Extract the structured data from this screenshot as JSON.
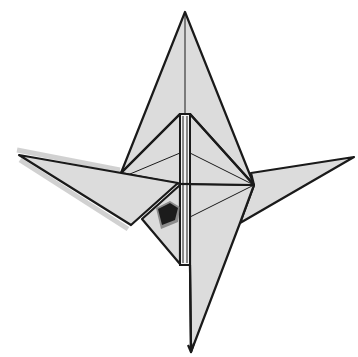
{
  "diagram": {
    "colors": {
      "paper": "#dcdcdc",
      "outline": "#1a1a1a",
      "background": "#ffffff",
      "strip": "#f4f4f4",
      "mark": "#1c1c1c"
    },
    "parts": [
      {
        "name": "top-point",
        "points": [
          [
            185,
            12
          ]
        ]
      },
      {
        "name": "left-wing",
        "tip": [
          19,
          155
        ]
      },
      {
        "name": "right-wing",
        "tip": [
          354,
          157
        ]
      },
      {
        "name": "bottom-point",
        "tip": [
          191,
          352
        ]
      },
      {
        "name": "central-strip",
        "x": [
          180,
          190
        ],
        "y": [
          114,
          265
        ]
      },
      {
        "name": "hub",
        "point": [
          254,
          185
        ]
      }
    ]
  }
}
